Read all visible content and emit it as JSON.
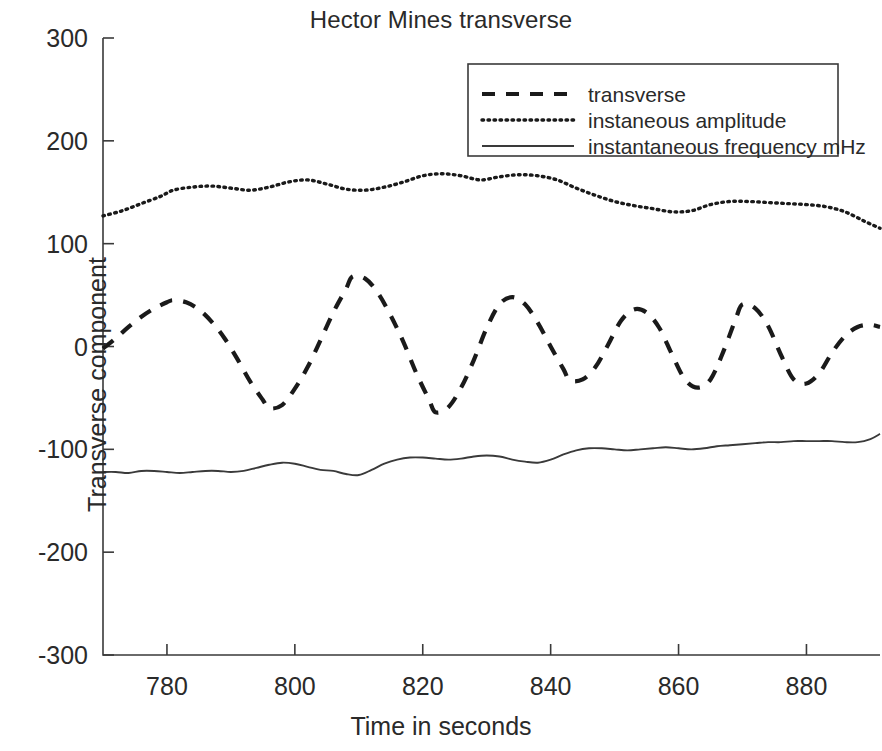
{
  "chart_data": {
    "type": "line",
    "title": "Hector Mines transverse",
    "xlabel": "Time in seconds",
    "ylabel": "Transverse component",
    "xlim": [
      770,
      891.5
    ],
    "ylim": [
      -300,
      300
    ],
    "xticks": [
      780,
      800,
      820,
      840,
      860,
      880
    ],
    "yticks": [
      300,
      200,
      100,
      0,
      -100,
      -200,
      -300
    ],
    "xtick_labels": [
      "780",
      "800",
      "820",
      "840",
      "860",
      "880"
    ],
    "ytick_labels": [
      "300",
      "200",
      "100",
      "0",
      "-100",
      "-200",
      "-300"
    ],
    "grid": false,
    "legend_position": "upper right",
    "series": [
      {
        "name": "transverse",
        "style": "dashed",
        "color": "#1a1a1a",
        "x": [
          770,
          772,
          774,
          776,
          778,
          780,
          781,
          783,
          785,
          787,
          789,
          791,
          793,
          795,
          796,
          798,
          800,
          802,
          804,
          806,
          808,
          809,
          811,
          813,
          815,
          817,
          819,
          821,
          822,
          824,
          826,
          828,
          830,
          832,
          834,
          836,
          838,
          840,
          842,
          843,
          845,
          847,
          849,
          851,
          853,
          855,
          857,
          859,
          861,
          863,
          865,
          867,
          869,
          870,
          872,
          874,
          876,
          878,
          880,
          882,
          884,
          886,
          888,
          890,
          891.5
        ],
        "y": [
          -2,
          8,
          19,
          29,
          37,
          43,
          45,
          43,
          36,
          24,
          8,
          -12,
          -34,
          -52,
          -60,
          -57,
          -41,
          -20,
          6,
          33,
          56,
          68,
          66,
          52,
          30,
          4,
          -26,
          -52,
          -64,
          -59,
          -40,
          -13,
          18,
          41,
          48,
          41,
          23,
          0,
          -22,
          -33,
          -32,
          -20,
          2,
          25,
          36,
          33,
          18,
          -8,
          -32,
          -40,
          -32,
          -5,
          28,
          41,
          37,
          20,
          -8,
          -32,
          -36,
          -26,
          -6,
          10,
          19,
          21,
          19
        ]
      },
      {
        "name": "instaneous amplitude",
        "style": "dotted",
        "color": "#1a1a1a",
        "x": [
          770,
          773,
          776,
          779,
          781,
          784,
          787,
          790,
          793,
          796,
          799,
          802,
          805,
          808,
          811,
          814,
          817,
          820,
          823,
          826,
          829,
          832,
          835,
          838,
          841,
          844,
          847,
          850,
          853,
          856,
          859,
          862,
          865,
          868,
          871,
          874,
          877,
          880,
          883,
          886,
          889,
          891.5
        ],
        "y": [
          127,
          132,
          139,
          146,
          152,
          155,
          156,
          154,
          152,
          155,
          160,
          162,
          158,
          153,
          152,
          155,
          160,
          166,
          168,
          166,
          162,
          165,
          167,
          166,
          162,
          154,
          147,
          141,
          137,
          134,
          131,
          132,
          138,
          141,
          141,
          140,
          139,
          138,
          136,
          131,
          122,
          115
        ]
      },
      {
        "name": "instantaneous frequency mHz",
        "style": "solid",
        "color": "#3a3a3a",
        "x": [
          770,
          772,
          774,
          776,
          778,
          780,
          782,
          784,
          786,
          788,
          790,
          792,
          794,
          796,
          798,
          800,
          802,
          804,
          806,
          808,
          810,
          812,
          814,
          816,
          818,
          820,
          822,
          824,
          826,
          828,
          830,
          832,
          834,
          836,
          838,
          840,
          842,
          844,
          846,
          848,
          850,
          852,
          854,
          856,
          858,
          860,
          862,
          864,
          866,
          868,
          870,
          872,
          874,
          876,
          878,
          880,
          882,
          884,
          886,
          888,
          890,
          891.5
        ],
        "y": [
          -122,
          -122,
          -123,
          -121,
          -121,
          -122,
          -123,
          -122,
          -121,
          -121,
          -122,
          -121,
          -118,
          -115,
          -113,
          -114,
          -117,
          -120,
          -121,
          -124,
          -125,
          -120,
          -114,
          -110,
          -108,
          -108,
          -109,
          -110,
          -109,
          -107,
          -106,
          -107,
          -110,
          -112,
          -113,
          -110,
          -105,
          -101,
          -99,
          -99,
          -100,
          -101,
          -100,
          -99,
          -98,
          -99,
          -100,
          -99,
          -97,
          -96,
          -95,
          -94,
          -93,
          -93,
          -92,
          -92,
          -92,
          -92,
          -93,
          -93,
          -90,
          -85
        ]
      }
    ]
  },
  "legend": {
    "items": [
      {
        "label": "transverse",
        "style": "dashed"
      },
      {
        "label": "instaneous amplitude",
        "style": "dotted"
      },
      {
        "label": "instantaneous frequency mHz",
        "style": "solid"
      }
    ]
  },
  "colors": {
    "axis": "#3a3a3a",
    "text": "#2a2a2a",
    "series": "#1a1a1a",
    "background": "#ffffff"
  }
}
